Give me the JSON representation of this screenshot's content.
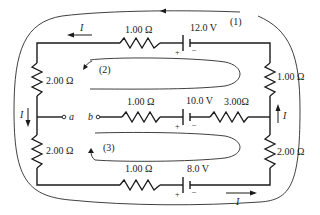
{
  "diagram": {
    "type": "circuit",
    "top_branch": {
      "resistor": "1.00 Ω",
      "battery": "12.0 V",
      "battery_plus": "+",
      "battery_minus": "–",
      "current_label": "I"
    },
    "middle_branch": {
      "terminal_a": "a",
      "terminal_b": "b",
      "resistor_1": "1.00 Ω",
      "battery": "10.0 V",
      "battery_plus": "+",
      "battery_minus": "–",
      "resistor_2": "3.00Ω"
    },
    "bottom_branch": {
      "resistor": "1.00 Ω",
      "battery": "8.0 V",
      "battery_plus": "+",
      "battery_minus": "–",
      "current_label": "I"
    },
    "left_side": {
      "resistor_top": "2.00 Ω",
      "resistor_bottom": "2.00 Ω",
      "current_label": "I"
    },
    "right_side": {
      "resistor_top": "1.00 Ω",
      "resistor_bottom": "2.00 Ω",
      "current_label": "I"
    },
    "loops": {
      "loop1": "(1)",
      "loop2": "(2)",
      "loop3": "(3)"
    }
  }
}
